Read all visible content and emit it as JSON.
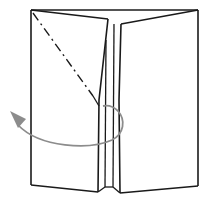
{
  "diagram": {
    "type": "origami-folding-step",
    "colors": {
      "line": "#1a1a1a",
      "arrow": "#8c8c8c",
      "background": "#ffffff"
    },
    "elements": [
      {
        "name": "outer-frame-top",
        "kind": "edge"
      },
      {
        "name": "left-flap",
        "kind": "panel"
      },
      {
        "name": "right-flap",
        "kind": "panel"
      },
      {
        "name": "center-slit",
        "kind": "edge-group"
      },
      {
        "name": "mountain-fold-line",
        "kind": "dash-dot-line"
      },
      {
        "name": "fold-behind-arrow",
        "kind": "curved-arrow"
      }
    ]
  }
}
